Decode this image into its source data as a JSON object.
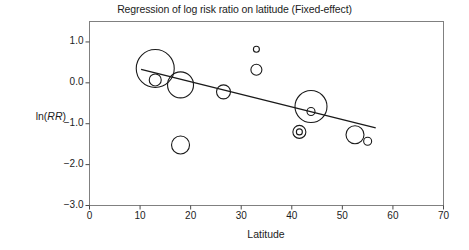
{
  "chart_data": {
    "type": "scatter",
    "title": "Regression of log risk ratio on latitude (Fixed-effect)",
    "xlabel": "Latitude",
    "ylabel": "ln(RR)",
    "ylabel_plain": "ln(",
    "ylabel_italic": "RR",
    "ylabel_close": ")",
    "xlim": [
      0,
      70
    ],
    "ylim": [
      -3.0,
      1.5
    ],
    "grid": false,
    "legend": null,
    "xticks": [
      "0",
      "10",
      "20",
      "30",
      "40",
      "50",
      "60",
      "70"
    ],
    "xtick_values": [
      0,
      10,
      20,
      30,
      40,
      50,
      60,
      70
    ],
    "yticks": [
      "1.0",
      "0.0",
      "-1.0",
      "-2.0",
      "-3.0"
    ],
    "ytick_values": [
      1.0,
      0.0,
      -1.0,
      -2.0,
      -3.0
    ],
    "marker": "open-circle-sized-by-weight",
    "points": [
      {
        "x": 13.0,
        "y": 0.35,
        "r": 19.0
      },
      {
        "x": 13.0,
        "y": 0.07,
        "r": 6.0
      },
      {
        "x": 18.0,
        "y": -0.05,
        "r": 13.0
      },
      {
        "x": 18.0,
        "y": -1.52,
        "r": 9.0
      },
      {
        "x": 26.5,
        "y": -0.22,
        "r": 7.0
      },
      {
        "x": 33.0,
        "y": 0.82,
        "r": 3.0
      },
      {
        "x": 33.0,
        "y": 0.32,
        "r": 5.5
      },
      {
        "x": 43.8,
        "y": -0.58,
        "r": 16.0
      },
      {
        "x": 43.8,
        "y": -0.7,
        "r": 4.0
      },
      {
        "x": 41.5,
        "y": -1.2,
        "r": 6.5
      },
      {
        "x": 41.5,
        "y": -1.2,
        "r": 3.0
      },
      {
        "x": 52.5,
        "y": -1.27,
        "r": 9.0
      },
      {
        "x": 55.0,
        "y": -1.43,
        "r": 4.0
      }
    ],
    "regression_line": {
      "x1": 10.2,
      "y1": 0.33,
      "x2": 56.6,
      "y2": -1.1
    },
    "colors": {
      "marker_stroke": "#1a1a1a",
      "line": "#1a1a1a",
      "frame": "#808080",
      "background": "#ffffff",
      "text": "#1c1c1c"
    }
  }
}
